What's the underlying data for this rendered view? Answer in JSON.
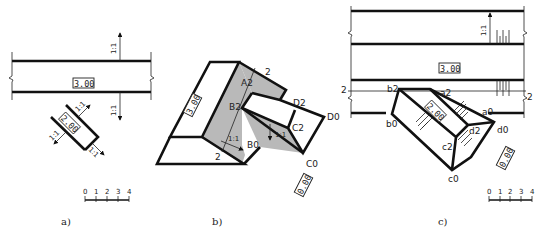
{
  "figure": {
    "panels": [
      {
        "id": "a",
        "caption": "a)",
        "road_elevation": "3.00",
        "ramp_elevation": "2.00",
        "slope_labels": [
          "1:1",
          "1:1",
          "1:1",
          "1:1",
          "1:1"
        ],
        "scale_ticks": [
          "0",
          "1",
          "2",
          "3",
          "4"
        ]
      },
      {
        "id": "b",
        "caption": "b)",
        "platform_elevation": "3.00",
        "ground_elevation": "0.00",
        "width_labels": [
          "2",
          "2"
        ],
        "slope_labels": [
          "1:1",
          "1:1"
        ],
        "points": [
          "A2",
          "B2",
          "B0",
          "C2",
          "C0",
          "D2",
          "D0"
        ]
      },
      {
        "id": "c",
        "caption": "c)",
        "road_elevation": "3.00",
        "ramp_elevation": "2.00",
        "ground_elevation": "0.00",
        "slope_label": "1:1",
        "section_marks": [
          "2",
          "2"
        ],
        "points": [
          "b2",
          "a2",
          "a0",
          "b0",
          "c2",
          "d2",
          "d0",
          "c0"
        ],
        "scale_ticks": [
          "0",
          "1",
          "2",
          "3",
          "4"
        ]
      }
    ]
  },
  "colors": {
    "line": "#111111",
    "shading": "#b9b9b9",
    "background": "#ffffff"
  }
}
